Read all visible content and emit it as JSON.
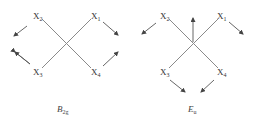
{
  "diagrams": [
    {
      "id": "b2g",
      "caption": {
        "main": "B",
        "sub": "2g"
      },
      "atoms": [
        {
          "name": "X",
          "index": "2",
          "x": 33,
          "y": 19
        },
        {
          "name": "X",
          "index": "1",
          "x": 91,
          "y": 19
        },
        {
          "name": "X",
          "index": "3",
          "x": 33,
          "y": 75
        },
        {
          "name": "X",
          "index": "4",
          "x": 91,
          "y": 75
        }
      ],
      "displacements": [
        {
          "from": [
            27,
            26
          ],
          "to": [
            14,
            36
          ]
        },
        {
          "from": [
            15,
            52
          ],
          "to": [
            30,
            64
          ]
        },
        {
          "from": [
            103,
            22
          ],
          "to": [
            118,
            35
          ]
        },
        {
          "from": [
            103,
            66
          ],
          "to": [
            118,
            52
          ]
        }
      ],
      "center_arrow": null
    },
    {
      "id": "eu",
      "caption": {
        "main": "E",
        "sub": "u"
      },
      "atoms": [
        {
          "name": "X",
          "index": "2",
          "x": 160,
          "y": 19
        },
        {
          "name": "X",
          "index": "1",
          "x": 217,
          "y": 19
        },
        {
          "name": "X",
          "index": "3",
          "x": 160,
          "y": 75
        },
        {
          "name": "X",
          "index": "4",
          "x": 217,
          "y": 75
        }
      ],
      "displacements": [
        {
          "from": [
            156,
            23
          ],
          "to": [
            142,
            34
          ]
        },
        {
          "from": [
            229,
            22
          ],
          "to": [
            243,
            34
          ]
        },
        {
          "from": [
            170,
            80
          ],
          "to": [
            185,
            92
          ]
        },
        {
          "from": [
            214,
            80
          ],
          "to": [
            201,
            92
          ]
        }
      ],
      "center_arrow": {
        "from": [
          193,
          42
        ],
        "to": [
          193,
          18
        ]
      }
    }
  ],
  "labels": {
    "b2g_x2": "X",
    "b2g_x2_sub": "2",
    "b2g_x1": "X",
    "b2g_x1_sub": "1",
    "b2g_x3": "X",
    "b2g_x3_sub": "3",
    "b2g_x4": "X",
    "b2g_x4_sub": "4",
    "b2g_caption": "B",
    "b2g_caption_sub": "2g",
    "eu_x2": "X",
    "eu_x2_sub": "2",
    "eu_x1": "X",
    "eu_x1_sub": "1",
    "eu_x3": "X",
    "eu_x3_sub": "3",
    "eu_x4": "X",
    "eu_x4_sub": "4",
    "eu_caption": "E",
    "eu_caption_sub": "u"
  }
}
